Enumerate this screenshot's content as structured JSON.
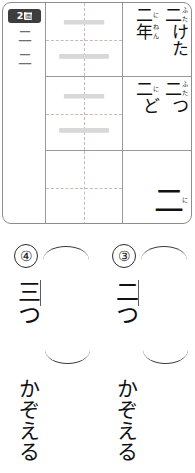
{
  "card": {
    "stroke_badge": {
      "count": "2",
      "unit": "画"
    },
    "readings": [
      "二",
      "二"
    ],
    "practice_cells": [
      {
        "trace": "二",
        "has_guide": true
      },
      {
        "trace": "二",
        "has_guide": true
      },
      {
        "trace": "",
        "has_guide": false
      }
    ],
    "vocabulary": [
      {
        "row": 1,
        "entries": [
          {
            "text": "二けた",
            "kanji": "二",
            "furigana": "ふた",
            "okurigana": "けた"
          },
          {
            "text": "二年",
            "kanji": "二",
            "furigana": "に",
            "second_kanji": "年",
            "second_furigana": "ねん"
          }
        ]
      },
      {
        "row": 2,
        "entries": [
          {
            "text": "二つ",
            "kanji": "二",
            "furigana": "ふた",
            "okurigana": "つ"
          },
          {
            "text": "二ど",
            "kanji": "二",
            "furigana": "に",
            "okurigana": "ど"
          }
        ]
      },
      {
        "row": 3,
        "entries": [
          {
            "text": "二",
            "kanji": "二",
            "furigana": "に",
            "okurigana": ""
          }
        ]
      }
    ]
  },
  "exercises": [
    {
      "number": "④",
      "answer": "三つ",
      "verb": "かぞえる"
    },
    {
      "number": "③",
      "answer": "二つ",
      "verb": "かぞえる"
    }
  ],
  "colors": {
    "frame": "#8d8d8d",
    "grid_line": "#9a9a9a",
    "guide_dash": "#c9b9b4",
    "trace_gray": "#d8d8d8",
    "badge_bg": "#3d3d3d",
    "ink": "#111111"
  }
}
